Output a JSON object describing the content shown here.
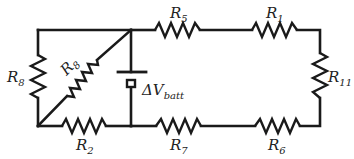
{
  "diagram": {
    "type": "circuit",
    "colors": {
      "wire": "#1a1a1a",
      "label": "#222222",
      "background": "#ffffff"
    },
    "components": [
      {
        "id": "R8_left",
        "kind": "resistor",
        "label": "R",
        "sub": "8",
        "position": "left vertical branch"
      },
      {
        "id": "R8_diag",
        "kind": "resistor",
        "label": "R",
        "sub": "8",
        "position": "diagonal branch"
      },
      {
        "id": "R2",
        "kind": "resistor",
        "label": "R",
        "sub": "2",
        "position": "bottom-left"
      },
      {
        "id": "R5",
        "kind": "resistor",
        "label": "R",
        "sub": "5",
        "position": "top-middle"
      },
      {
        "id": "R1",
        "kind": "resistor",
        "label": "R",
        "sub": "1",
        "position": "top-right"
      },
      {
        "id": "R11",
        "kind": "resistor",
        "label": "R",
        "sub": "11",
        "position": "right vertical"
      },
      {
        "id": "R7",
        "kind": "resistor",
        "label": "R",
        "sub": "7",
        "position": "bottom-middle"
      },
      {
        "id": "R6",
        "kind": "resistor",
        "label": "R",
        "sub": "6",
        "position": "bottom-right"
      },
      {
        "id": "batt",
        "kind": "battery",
        "label": "ΔV",
        "sub": "batt",
        "position": "center vertical"
      }
    ]
  }
}
